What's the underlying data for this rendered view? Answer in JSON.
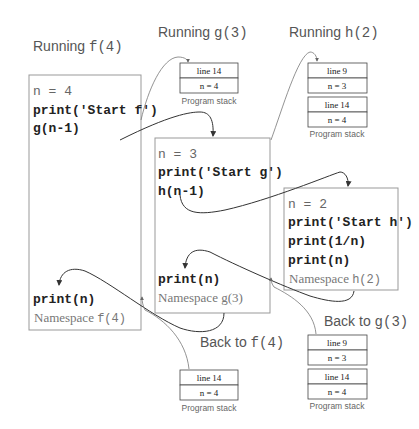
{
  "titles": {
    "running_f": {
      "prefix": "Running ",
      "fn": "f(4)"
    },
    "running_g": {
      "prefix": "Running ",
      "fn": "g(3)"
    },
    "running_h": {
      "prefix": "Running ",
      "fn": "h(2)"
    },
    "back_to_f": {
      "prefix": "Back to ",
      "fn": "f(4)"
    },
    "back_to_g": {
      "prefix": "Back to ",
      "fn": "g(3)"
    }
  },
  "namespaces": {
    "f": {
      "lines": [
        "n = 4",
        "print('Start f')",
        "g(n-1)"
      ],
      "after": "print(n)",
      "label_prefix": "Namespace ",
      "label_fn": "f(4)"
    },
    "g": {
      "lines": [
        "n = 3",
        "print('Start g')",
        "h(n-1)"
      ],
      "after": "print(n)",
      "label": "Namespace g(3)"
    },
    "h": {
      "lines": [
        "n = 2",
        "print('Start h')",
        "print(1/n)",
        "print(n)"
      ],
      "label_prefix": "Namespace ",
      "label_fn": "h(2)"
    }
  },
  "stacks": {
    "running_g": {
      "frames": [
        {
          "line": "line 14",
          "var": "n = 4"
        }
      ],
      "label": "Program stack"
    },
    "running_h": {
      "frames": [
        {
          "line": "line 9",
          "var": "n = 3"
        },
        {
          "line": "line 14",
          "var": "n = 4"
        }
      ],
      "label": "Program stack"
    },
    "back_to_f": {
      "frames": [
        {
          "line": "line 14",
          "var": "n = 4"
        }
      ],
      "label": "Program stack"
    },
    "back_to_g": {
      "frames": [
        {
          "line": "line 9",
          "var": "n = 3"
        },
        {
          "line": "line 14",
          "var": "n = 4"
        }
      ],
      "label": "Program stack"
    }
  },
  "colors": {
    "text": "#222222",
    "label": "#555555",
    "box_border": "#999999",
    "arrow": "#333333"
  }
}
